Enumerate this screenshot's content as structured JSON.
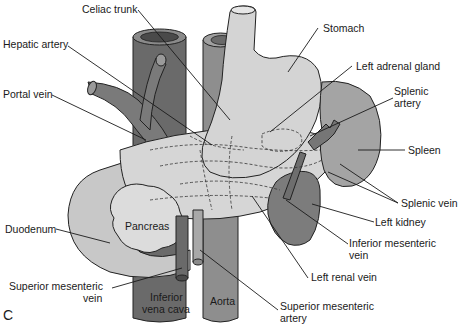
{
  "figure": {
    "panel_letter": "C",
    "colors": {
      "ivc": "#6a6a6a",
      "aorta": "#8e8e8e",
      "stomach": "#d4d4d4",
      "duodenum": "#c8c8c8",
      "pancreas": "#d8d8d8",
      "spleen": "#a4a4a4",
      "kidney": "#7c7c7c",
      "portal_vein": "#7a7a7a",
      "splenic_vessels": "#767676"
    },
    "labels": {
      "celiac_trunk": "Celiac trunk",
      "hepatic_artery": "Hepatic artery",
      "portal_vein": "Portal vein",
      "stomach": "Stomach",
      "left_adrenal_gland": "Left adrenal gland",
      "splenic_artery_1": "Splenic",
      "splenic_artery_2": "artery",
      "spleen": "Spleen",
      "splenic_vein": "Splenic vein",
      "left_kidney": "Left kidney",
      "inferior_mesenteric_vein_1": "Inferior mesenteric",
      "inferior_mesenteric_vein_2": "vein",
      "left_renal_vein": "Left renal vein",
      "superior_mesenteric_artery_1": "Superior mesenteric",
      "superior_mesenteric_artery_2": "artery",
      "duodenum": "Duodenum",
      "superior_mesenteric_vein_1": "Superior mesenteric",
      "superior_mesenteric_vein_2": "vein",
      "pancreas": "Pancreas",
      "inferior_vena_cava_1": "Inferior",
      "inferior_vena_cava_2": "vena cava",
      "aorta": "Aorta"
    }
  }
}
